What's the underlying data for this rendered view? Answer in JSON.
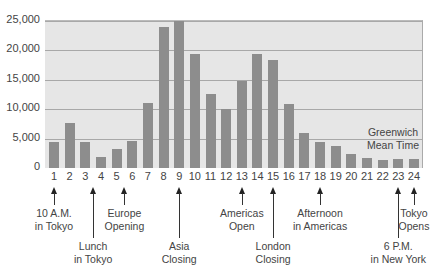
{
  "chart_data": {
    "type": "bar",
    "title": "",
    "xlabel": "",
    "ylabel": "",
    "ylim": [
      0,
      25000
    ],
    "grid": true,
    "yticks": [
      "0",
      "5,000",
      "10,000",
      "15,000",
      "20,000",
      "25,000"
    ],
    "categories": [
      "1",
      "2",
      "3",
      "4",
      "5",
      "6",
      "7",
      "8",
      "9",
      "10",
      "11",
      "12",
      "13",
      "14",
      "15",
      "16",
      "17",
      "18",
      "19",
      "20",
      "21",
      "22",
      "23",
      "24"
    ],
    "values": [
      4500,
      7700,
      4500,
      1800,
      3200,
      4600,
      11000,
      24000,
      25000,
      19400,
      12600,
      10000,
      14800,
      19400,
      18300,
      10900,
      6000,
      4500,
      3700,
      2400,
      1700,
      1300,
      1500,
      1500
    ],
    "annotation_in_plot": "Greenwich Mean Time",
    "annotations": [
      {
        "hour": 1,
        "text": [
          "10 A.M.",
          "in Tokyo"
        ],
        "level": 1
      },
      {
        "hour": 3.5,
        "text": [
          "Lunch",
          "in Tokyo"
        ],
        "level": 2
      },
      {
        "hour": 5.5,
        "text": [
          "Europe",
          "Opening"
        ],
        "level": 1
      },
      {
        "hour": 9,
        "text": [
          "Asia",
          "Closing"
        ],
        "level": 2
      },
      {
        "hour": 13,
        "text": [
          "Americas",
          "Open"
        ],
        "level": 1
      },
      {
        "hour": 15,
        "text": [
          "London",
          "Closing"
        ],
        "level": 2
      },
      {
        "hour": 18,
        "text": [
          "Afternoon",
          "in Americas"
        ],
        "level": 1
      },
      {
        "hour": 23,
        "text": [
          "6 P.M.",
          "in New York"
        ],
        "level": 2
      },
      {
        "hour": 24,
        "text": [
          "Tokyo",
          "Opens"
        ],
        "level": 1
      }
    ],
    "colors": {
      "bar": "#8d8d8d",
      "plot_bg": "#e6e6e6",
      "grid": "#a8a8a8"
    }
  },
  "gmt_label": {
    "line1": "Greenwich",
    "line2": "Mean Time"
  }
}
